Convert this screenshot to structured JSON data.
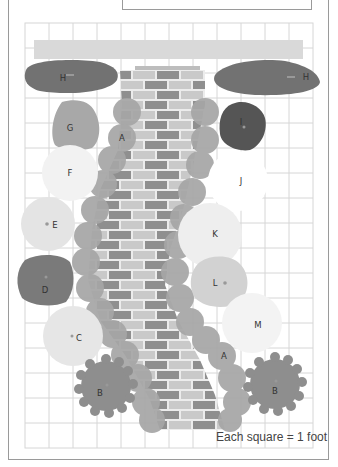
{
  "header": {
    "title": "CHAPTER TWO"
  },
  "caption": "Each square = 1 foot",
  "grid": {
    "left": 25,
    "top": 23,
    "cols": 12,
    "rows": 17,
    "cell": 24,
    "cell_h": 25,
    "line_color": "#d6d6d6"
  },
  "colors": {
    "wall": "#d9d9d9",
    "brick_dark": "#8f8f8f",
    "brick_light": "#c9c9c9",
    "mortar": "#ececec",
    "plant_A": "#a6a6a6",
    "plant_B": "#8e8e8e",
    "plant_C": "#e6e6e6",
    "plant_D": "#7a7a7a",
    "plant_E": "#e4e4e4",
    "plant_F": "#f2f2f2",
    "plant_G": "#a8a8a8",
    "plant_H": "#727272",
    "plant_I": "#555555",
    "plant_J": "#ffffff",
    "plant_K": "#eeeeee",
    "plant_L": "#d2d2d2",
    "plant_M": "#f3f3f3"
  },
  "plants": [
    {
      "key": "H",
      "label": "H",
      "x": 60,
      "y": 76
    },
    {
      "key": "H",
      "label": "H",
      "x": 297,
      "y": 77
    },
    {
      "key": "G",
      "label": "G",
      "x": 70,
      "y": 128
    },
    {
      "key": "A",
      "label": "A",
      "x": 122,
      "y": 138
    },
    {
      "key": "I",
      "label": "I",
      "x": 240,
      "y": 123
    },
    {
      "key": "F",
      "label": "F",
      "x": 70,
      "y": 173
    },
    {
      "key": "J",
      "label": "J",
      "x": 240,
      "y": 182
    },
    {
      "key": "E",
      "label": "E",
      "x": 54,
      "y": 225
    },
    {
      "key": "K",
      "label": "K",
      "x": 215,
      "y": 234
    },
    {
      "key": "D",
      "label": "D",
      "x": 45,
      "y": 290
    },
    {
      "key": "L",
      "label": "L",
      "x": 214,
      "y": 283
    },
    {
      "key": "M",
      "label": "M",
      "x": 258,
      "y": 325
    },
    {
      "key": "C",
      "label": "C",
      "x": 78,
      "y": 338
    },
    {
      "key": "A",
      "label": "A",
      "x": 224,
      "y": 356
    },
    {
      "key": "B",
      "label": "B",
      "x": 100,
      "y": 393
    },
    {
      "key": "B",
      "label": "B",
      "x": 275,
      "y": 391
    }
  ]
}
